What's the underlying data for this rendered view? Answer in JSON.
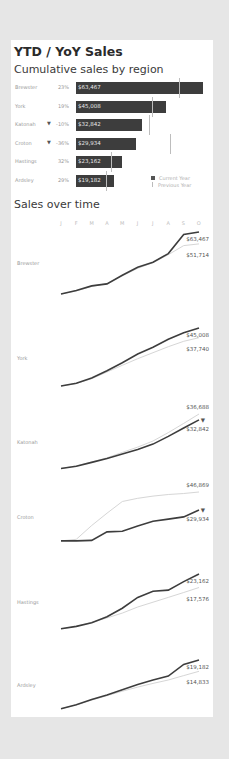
{
  "dashboard": {
    "title": "YTD / YoY Sales",
    "bar_section_title": "Cumulative sales by region",
    "line_section_title": "Sales over time"
  },
  "legend": {
    "current": "Current Year",
    "previous": "Previous Year"
  },
  "colors": {
    "current_year": "#3d3d3d",
    "previous_year": "#d0d0d0",
    "background": "#e6e6e6",
    "card": "#ffffff"
  },
  "bars": [
    {
      "region": "Brewster",
      "arrow": "",
      "pct": "23%",
      "value": "$63,467",
      "current": 63467,
      "previous": 51714
    },
    {
      "region": "York",
      "arrow": "",
      "pct": "19%",
      "value": "$45,008",
      "current": 45008,
      "previous": 37740
    },
    {
      "region": "Katonah",
      "arrow": "▼",
      "pct": "-10%",
      "value": "$32,842",
      "current": 32842,
      "previous": 36688
    },
    {
      "region": "Croton",
      "arrow": "▼",
      "pct": "-36%",
      "value": "$29,934",
      "current": 29934,
      "previous": 46869
    },
    {
      "region": "Hastings",
      "arrow": "",
      "pct": "32%",
      "value": "$23,162",
      "current": 23162,
      "previous": 17576
    },
    {
      "region": "Ardsley",
      "arrow": "",
      "pct": "29%",
      "value": "$19,182",
      "current": 19182,
      "previous": 14833
    }
  ],
  "months": [
    "J",
    "F",
    "M",
    "A",
    "M",
    "J",
    "J",
    "A",
    "S",
    "O"
  ],
  "lines": [
    {
      "region": "Brewster",
      "top_label": "$63,467",
      "bottom_label": "$51,714",
      "arrow": ""
    },
    {
      "region": "York",
      "top_label": "$45,008",
      "bottom_label": "$37,740",
      "arrow": ""
    },
    {
      "region": "Katonah",
      "top_label": "$36,688",
      "bottom_label": "$32,842",
      "arrow": "▼"
    },
    {
      "region": "Croton",
      "top_label": "$46,869",
      "bottom_label": "$29,934",
      "arrow": "▼"
    },
    {
      "region": "Hastings",
      "top_label": "$23,162",
      "bottom_label": "$17,576",
      "arrow": ""
    },
    {
      "region": "Ardsley",
      "top_label": "$19,182",
      "bottom_label": "$14,833",
      "arrow": ""
    }
  ],
  "chart_data": [
    {
      "type": "bar",
      "title": "Cumulative sales by region",
      "categories": [
        "Brewster",
        "York",
        "Katonah",
        "Croton",
        "Hastings",
        "Ardsley"
      ],
      "series": [
        {
          "name": "Current Year",
          "values": [
            63467,
            45008,
            32842,
            29934,
            23162,
            19182
          ]
        },
        {
          "name": "Previous Year",
          "values": [
            51714,
            37740,
            36688,
            46869,
            17576,
            14833
          ]
        }
      ],
      "yoy_change_pct": [
        23,
        19,
        -10,
        -36,
        32,
        29
      ],
      "legend_position": "bottom-right",
      "orientation": "horizontal"
    },
    {
      "type": "line",
      "title": "Sales over time",
      "x": [
        "J",
        "F",
        "M",
        "A",
        "M",
        "J",
        "J",
        "A",
        "S",
        "O"
      ],
      "panels": [
        {
          "region": "Brewster",
          "series": [
            {
              "name": "Current Year",
              "values": [
                2000,
                5500,
                10000,
                12000,
                20500,
                28500,
                33500,
                42000,
                61000,
                63467
              ]
            },
            {
              "name": "Previous Year",
              "values": [
                2000,
                5000,
                9500,
                12500,
                20000,
                27500,
                33000,
                41000,
                50000,
                51714
              ]
            }
          ]
        },
        {
          "region": "York",
          "series": [
            {
              "name": "Current Year",
              "values": [
                1500,
                3500,
                7500,
                13000,
                19000,
                25500,
                30500,
                36500,
                41500,
                45008
              ]
            },
            {
              "name": "Previous Year",
              "values": [
                1500,
                3300,
                7000,
                12000,
                17000,
                22000,
                26500,
                31000,
                35000,
                37740
              ]
            }
          ]
        },
        {
          "region": "Katonah",
          "series": [
            {
              "name": "Current Year",
              "values": [
                1000,
                2500,
                5000,
                7500,
                10500,
                13500,
                17000,
                22000,
                27500,
                32842
              ]
            },
            {
              "name": "Previous Year",
              "values": [
                1000,
                2700,
                5300,
                8000,
                11500,
                15000,
                19000,
                24500,
                30500,
                36688
              ]
            }
          ]
        },
        {
          "region": "Croton",
          "series": [
            {
              "name": "Current Year",
              "values": [
                1000,
                1000,
                1500,
                9500,
                10000,
                15000,
                19500,
                21500,
                23500,
                29934
              ]
            },
            {
              "name": "Previous Year",
              "values": [
                1000,
                2500,
                15500,
                27000,
                38000,
                41000,
                43000,
                44500,
                45500,
                46869
              ]
            }
          ]
        },
        {
          "region": "Hastings",
          "series": [
            {
              "name": "Current Year",
              "values": [
                500,
                1500,
                3000,
                5500,
                9000,
                13500,
                16000,
                16500,
                20000,
                23162
              ]
            },
            {
              "name": "Previous Year",
              "values": [
                500,
                1500,
                3200,
                5000,
                7000,
                9500,
                11500,
                13500,
                15500,
                17576
              ]
            }
          ]
        },
        {
          "region": "Ardsley",
          "series": [
            {
              "name": "Current Year",
              "values": [
                500,
                2000,
                4000,
                5800,
                7800,
                9800,
                11500,
                13000,
                17500,
                19182
              ]
            },
            {
              "name": "Previous Year",
              "values": [
                500,
                2000,
                3800,
                5500,
                7200,
                8800,
                10200,
                11500,
                13200,
                14833
              ]
            }
          ]
        }
      ]
    }
  ]
}
